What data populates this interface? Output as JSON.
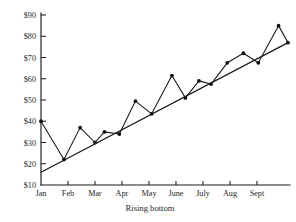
{
  "chart_data": {
    "type": "line",
    "title": "",
    "xlabel": "Rising bottom",
    "ylabel": "",
    "grid": false,
    "legend": "none",
    "xlim": [
      0,
      10.2
    ],
    "ylim": [
      10,
      95
    ],
    "ytick_labels": [
      "$90",
      "$80",
      "$70",
      "$60",
      "$50",
      "$40",
      "$30",
      "$20",
      "$10"
    ],
    "ytick_values": [
      90,
      80,
      70,
      60,
      50,
      40,
      30,
      20,
      10
    ],
    "categories": [
      "Jan",
      "Feb",
      "Mar",
      "Apr",
      "May",
      "June",
      "July",
      "Aug",
      "Sept"
    ],
    "xtick_values": [
      1,
      2,
      3,
      4,
      5,
      6,
      7,
      8,
      9
    ],
    "series": [
      {
        "name": "price",
        "x": [
          1.0,
          1.85,
          2.45,
          3.0,
          3.35,
          3.9,
          4.5,
          5.1,
          5.85,
          6.35,
          6.85,
          7.3,
          7.9,
          8.5,
          9.05,
          9.8,
          10.15
        ],
        "values": [
          40,
          22,
          37,
          30,
          35,
          34,
          49.5,
          43.5,
          61.5,
          51,
          59,
          57.5,
          67.5,
          72,
          67.5,
          85,
          77
        ]
      },
      {
        "name": "rising-bottom-trendline",
        "x": [
          1.0,
          10.15
        ],
        "values": [
          16,
          77
        ]
      }
    ],
    "annotations": []
  }
}
